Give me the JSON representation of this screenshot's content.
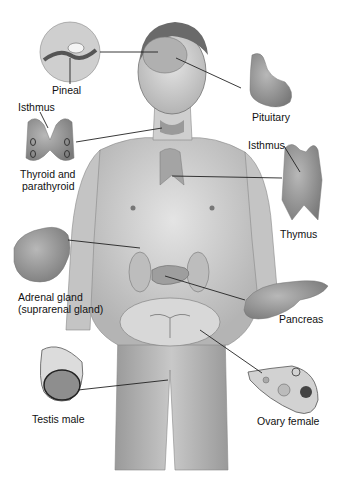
{
  "diagram": {
    "colors": {
      "skin": "#d6d6d6",
      "skin_dark": "#a8a8a8",
      "outline": "#555555",
      "leader": "#222222",
      "gland": "#9a9a9a",
      "background": "#ffffff"
    },
    "labels": {
      "pineal": "Pineal",
      "pituitary": "Pituitary",
      "isthmus_thyroid": "Isthmus",
      "thyroid_line1": "Thyroid and",
      "thyroid_line2": "parathyroid",
      "isthmus_thymus": "Isthmus",
      "thymus": "Thymus",
      "adrenal_line1": "Adrenal gland",
      "adrenal_line2": "(suprarenal gland)",
      "pancreas": "Pancreas",
      "testis": "Testis male",
      "ovary": "Ovary female"
    }
  }
}
